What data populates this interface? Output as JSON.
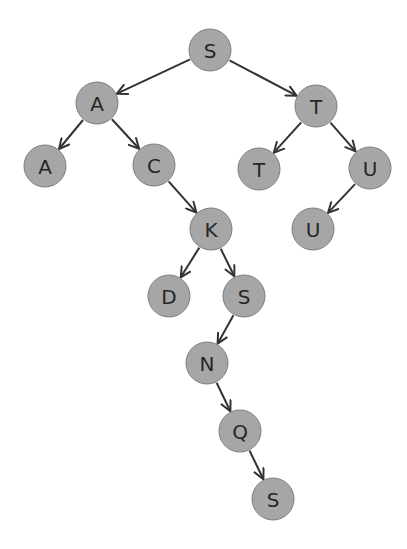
{
  "diagram": {
    "type": "tree",
    "style": {
      "node_fill": "#a6a6a6",
      "node_stroke": "#7f7f7f",
      "edge_color": "#333333",
      "label_color": "#262626",
      "node_radius": 21
    },
    "nodes": [
      {
        "id": "n1",
        "label": "S",
        "x": 210,
        "y": 50
      },
      {
        "id": "n2",
        "label": "A",
        "x": 97,
        "y": 103
      },
      {
        "id": "n3",
        "label": "T",
        "x": 316,
        "y": 106
      },
      {
        "id": "n4",
        "label": "A",
        "x": 45,
        "y": 166
      },
      {
        "id": "n5",
        "label": "C",
        "x": 154,
        "y": 165
      },
      {
        "id": "n6",
        "label": "T",
        "x": 259,
        "y": 169
      },
      {
        "id": "n7",
        "label": "U",
        "x": 370,
        "y": 168
      },
      {
        "id": "n8",
        "label": "K",
        "x": 211,
        "y": 229
      },
      {
        "id": "n9",
        "label": "U",
        "x": 313,
        "y": 229
      },
      {
        "id": "n10",
        "label": "D",
        "x": 169,
        "y": 296
      },
      {
        "id": "n11",
        "label": "S",
        "x": 244,
        "y": 296
      },
      {
        "id": "n12",
        "label": "N",
        "x": 207,
        "y": 363
      },
      {
        "id": "n13",
        "label": "Q",
        "x": 240,
        "y": 431
      },
      {
        "id": "n14",
        "label": "S",
        "x": 273,
        "y": 499
      }
    ],
    "edges": [
      {
        "from": "n1",
        "to": "n2"
      },
      {
        "from": "n1",
        "to": "n3"
      },
      {
        "from": "n2",
        "to": "n4"
      },
      {
        "from": "n2",
        "to": "n5"
      },
      {
        "from": "n3",
        "to": "n6"
      },
      {
        "from": "n3",
        "to": "n7"
      },
      {
        "from": "n5",
        "to": "n8"
      },
      {
        "from": "n7",
        "to": "n9"
      },
      {
        "from": "n8",
        "to": "n10"
      },
      {
        "from": "n8",
        "to": "n11"
      },
      {
        "from": "n11",
        "to": "n12"
      },
      {
        "from": "n12",
        "to": "n13"
      },
      {
        "from": "n13",
        "to": "n14"
      }
    ]
  }
}
